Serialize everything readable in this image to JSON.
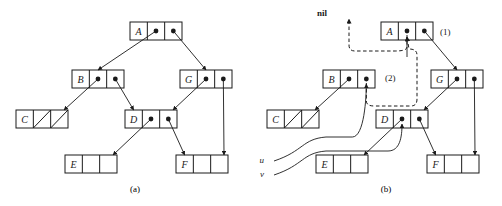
{
  "figure": {
    "background_color": "#ffffff",
    "line_color": "#1a1a1a",
    "panels": [
      {
        "id": "a",
        "caption": "(a)",
        "origin_x": 0,
        "nodes": [
          {
            "name": "node-a",
            "label": "A",
            "x": 130,
            "y": 22,
            "left_cell": "pointer",
            "right_cell": "pointer"
          },
          {
            "name": "node-b",
            "label": "B",
            "x": 72,
            "y": 70,
            "left_cell": "pointer",
            "right_cell": "pointer"
          },
          {
            "name": "node-g",
            "label": "G",
            "x": 180,
            "y": 70,
            "left_cell": "pointer",
            "right_cell": "pointer"
          },
          {
            "name": "node-c",
            "label": "C",
            "x": 16,
            "y": 110,
            "left_cell": "null",
            "right_cell": "null"
          },
          {
            "name": "node-d",
            "label": "D",
            "x": 125,
            "y": 110,
            "left_cell": "pointer",
            "right_cell": "pointer"
          },
          {
            "name": "node-e",
            "label": "E",
            "x": 65,
            "y": 155,
            "left_cell": "empty",
            "right_cell": "empty"
          },
          {
            "name": "node-f",
            "label": "F",
            "x": 176,
            "y": 155,
            "left_cell": "empty",
            "right_cell": "empty"
          }
        ],
        "links": [
          {
            "from": "A.left",
            "to": "B.top"
          },
          {
            "from": "A.right",
            "to": "G.top"
          },
          {
            "from": "B.left",
            "to": "C.topright"
          },
          {
            "from": "B.right",
            "to": "D.topleft"
          },
          {
            "from": "G.left",
            "to": "D.topright"
          },
          {
            "from": "G.right",
            "to": "F.topright"
          },
          {
            "from": "D.left",
            "to": "E.topright"
          },
          {
            "from": "D.right",
            "to": "F.topleft"
          }
        ],
        "labels": []
      },
      {
        "id": "b",
        "caption": "(b)",
        "origin_x": 251,
        "nodes": [
          {
            "name": "node-a",
            "label": "A",
            "x": 381,
            "y": 22,
            "left_cell": "pointer",
            "right_cell": "pointer"
          },
          {
            "name": "node-b",
            "label": "B",
            "x": 323,
            "y": 70,
            "left_cell": "pointer",
            "right_cell": "pointer"
          },
          {
            "name": "node-g",
            "label": "G",
            "x": 431,
            "y": 70,
            "left_cell": "pointer",
            "right_cell": "pointer"
          },
          {
            "name": "node-c",
            "label": "C",
            "x": 267,
            "y": 110,
            "left_cell": "null",
            "right_cell": "null"
          },
          {
            "name": "node-d",
            "label": "D",
            "x": 376,
            "y": 110,
            "left_cell": "pointer",
            "right_cell": "pointer"
          },
          {
            "name": "node-e",
            "label": "E",
            "x": 316,
            "y": 155,
            "left_cell": "empty",
            "right_cell": "empty"
          },
          {
            "name": "node-f",
            "label": "F",
            "x": 427,
            "y": 155,
            "left_cell": "empty",
            "right_cell": "empty"
          }
        ],
        "links": [
          {
            "from": "A.right",
            "to": "G.top"
          },
          {
            "from": "B.left",
            "to": "C.topright"
          },
          {
            "from": "G.left",
            "to": "D.topright"
          },
          {
            "from": "G.right",
            "to": "F.topright"
          },
          {
            "from": "D.left",
            "to": "E.topright"
          },
          {
            "from": "D.right",
            "to": "F.topleft"
          }
        ],
        "dashed_links": [
          {
            "name": "dashed-a-left-to-nil",
            "from": "A.left",
            "to": "nil",
            "label": "(1)"
          },
          {
            "name": "dashed-b-right-to-a-left",
            "from": "B.right",
            "to": "A.left",
            "label": "(2)"
          }
        ],
        "pointer_variables": [
          {
            "name": "pointer-u",
            "label": "u",
            "x": 264,
            "y": 159,
            "target": "B.right"
          },
          {
            "name": "pointer-v",
            "label": "v",
            "x": 264,
            "y": 173,
            "target": "D.left"
          }
        ],
        "labels": [
          {
            "name": "nil-label",
            "text": "nil",
            "x": 317,
            "y": 8,
            "bold": true
          },
          {
            "name": "step-1-label",
            "text": "(1)",
            "x": 440,
            "y": 27,
            "bold": false
          },
          {
            "name": "step-2-label",
            "text": "(2)",
            "x": 385,
            "y": 73,
            "bold": false
          }
        ]
      }
    ]
  }
}
